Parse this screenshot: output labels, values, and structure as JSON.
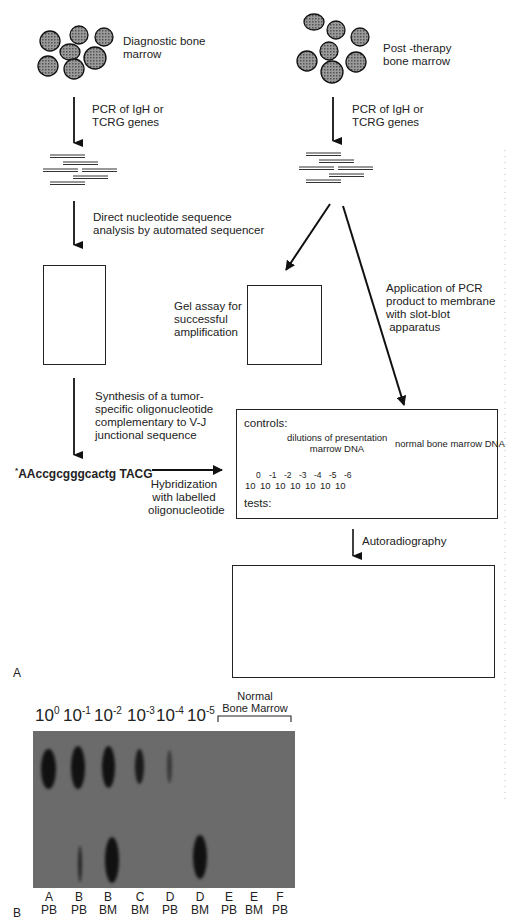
{
  "panel_a": {
    "label": "A",
    "left_column": {
      "source_label": "Diagnostic bone\nmarrow",
      "step1_label": "PCR of IgH or\nTCRG genes",
      "step2_label": "Direct nucleotide sequence\nanalysis by automated sequencer",
      "step3_label": "Synthesis of a tumor-\nspecific oligonucleotide\ncomplementary to V-J\njunctional sequence",
      "oligo_sequence_mark": "*",
      "oligo_sequence": "AAccgcgggcactg TACG",
      "hybridization_label": "Hybridization\nwith labelled\noligonucleotide"
    },
    "right_column": {
      "source_label": "Post -therapy\nbone marrow",
      "step1_label": "PCR of IgH or\nTCRG genes",
      "gel_assay_label": "Gel assay for\nsuccessful\namplification",
      "application_label": "Application of PCR\nproduct to membrane\nwith slot-blot\n apparatus",
      "autoradiography_label": "Autoradiography"
    },
    "membrane": {
      "controls_label": "controls:",
      "dilutions_label": "dilutions of presentation\nmarrow DNA",
      "normal_label": "normal bone marrow DNA",
      "tests_label": "tests:",
      "dilution_exponents": [
        "0",
        "-1",
        "-2",
        "-3",
        "-4",
        "-5",
        "-6"
      ],
      "dilution_base": "10",
      "normal_slot_count": 5,
      "test_slot_count": 10
    },
    "autoradiograph": {
      "control_row": [
        "dark",
        "dark",
        "dark",
        "dark",
        "dark",
        "faint",
        "empty",
        "empty",
        "empty",
        "empty",
        "empty",
        "empty"
      ],
      "test_row": [
        "dark",
        "dark",
        "dark",
        "faint",
        "empty",
        "empty",
        "empty",
        "empty",
        "empty",
        "empty"
      ]
    }
  },
  "panel_b": {
    "label": "B",
    "dilution_headers": [
      {
        "base": "10",
        "exp": "0"
      },
      {
        "base": "10",
        "exp": "-1"
      },
      {
        "base": "10",
        "exp": "-2"
      },
      {
        "base": "10",
        "exp": "-3"
      },
      {
        "base": "10",
        "exp": "-4"
      },
      {
        "base": "10",
        "exp": "-5"
      }
    ],
    "normal_header_line1": "Normal",
    "normal_header_line2": "Bone Marrow",
    "lanes": [
      {
        "patient": "A",
        "tissue": "PB"
      },
      {
        "patient": "B",
        "tissue": "PB"
      },
      {
        "patient": "B",
        "tissue": "BM"
      },
      {
        "patient": "C",
        "tissue": "BM"
      },
      {
        "patient": "D",
        "tissue": "PB"
      },
      {
        "patient": "D",
        "tissue": "BM"
      },
      {
        "patient": "E",
        "tissue": "PB"
      },
      {
        "patient": "E",
        "tissue": "BM"
      },
      {
        "patient": "F",
        "tissue": "PB"
      }
    ]
  }
}
